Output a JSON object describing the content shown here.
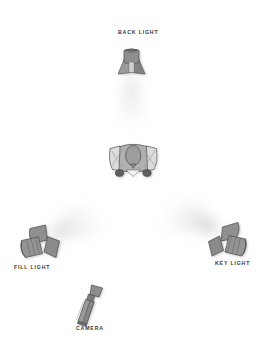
{
  "diagram": {
    "type": "lighting-diagram",
    "canvas": {
      "width": 266,
      "height": 347
    },
    "background_color": "#ffffff",
    "label_color": "#3a3a3a",
    "fixture_fill_color": "#8c8c8c",
    "fixture_shade_color": "#707070",
    "fixture_outline_color": "#4a4a4a",
    "beam_color": "#b5b5b5",
    "subject_fill_color": "#d8d8d8",
    "subject_head_color": "#9a9a9a",
    "labels": {
      "back_light": "BACK LIGHT",
      "fill_light": "FILL LIGHT",
      "key_light": "KEY LIGHT",
      "camera": "CAMERA"
    },
    "elements": [
      {
        "name": "back-light",
        "label": "BACK LIGHT",
        "position": {
          "x": 131,
          "y": 62
        },
        "beam_direction": "down",
        "beam_target": "subject"
      },
      {
        "name": "subject",
        "label": "",
        "position": {
          "x": 133,
          "y": 158
        },
        "description": "top-down view of a person"
      },
      {
        "name": "fill-light",
        "label": "FILL LIGHT",
        "position": {
          "x": 37,
          "y": 243
        },
        "beam_direction": "up-right",
        "beam_target": "subject"
      },
      {
        "name": "key-light",
        "label": "KEY LIGHT",
        "position": {
          "x": 231,
          "y": 239
        },
        "beam_direction": "up-left",
        "beam_target": "subject"
      },
      {
        "name": "camera",
        "label": "CAMERA",
        "position": {
          "x": 88,
          "y": 303
        },
        "beam_direction": "up-right",
        "beam_target": "subject"
      }
    ]
  }
}
